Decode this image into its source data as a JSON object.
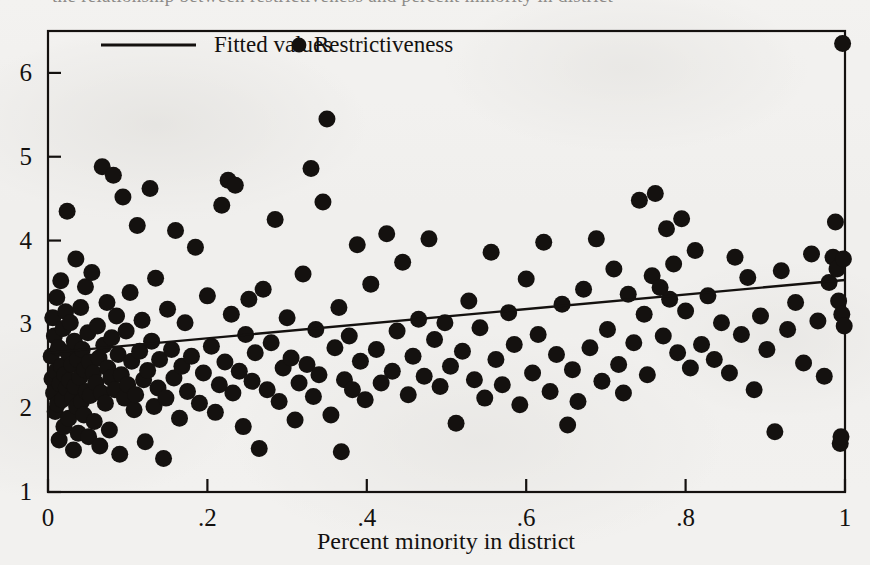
{
  "figure": {
    "caption_ghost": "the relationship between restrictiveness and percent minority in district",
    "background_color": "#f2f1ef",
    "ink_color": "#14110f"
  },
  "legend": {
    "position": "top-inside",
    "entries": [
      {
        "label": "Fitted values",
        "marker": "line",
        "color": "#14110f"
      },
      {
        "label": "Restrictiveness",
        "marker": "circle",
        "color": "#14110f"
      }
    ]
  },
  "chart_data": {
    "type": "scatter",
    "title": "",
    "subtitle": "",
    "xlabel": "Percent minority in district",
    "ylabel": "",
    "xlim": [
      0,
      1
    ],
    "ylim": [
      1,
      6.5
    ],
    "grid": false,
    "xticks": [
      0,
      0.2,
      0.4,
      0.6,
      0.8,
      1
    ],
    "xticklabels": [
      "0",
      ".2",
      ".4",
      ".6",
      ".8",
      "1"
    ],
    "yticks": [
      1,
      2,
      3,
      4,
      5,
      6
    ],
    "yticklabels": [
      "1",
      "2",
      "3",
      "4",
      "5",
      "6"
    ],
    "marker_color": "#14110f",
    "marker_size": 9,
    "series": [
      {
        "name": "Restrictiveness",
        "type": "scatter",
        "points": [
          [
            0.004,
            2.62
          ],
          [
            0.005,
            2.35
          ],
          [
            0.006,
            3.08
          ],
          [
            0.007,
            2.18
          ],
          [
            0.008,
            2.86
          ],
          [
            0.009,
            1.96
          ],
          [
            0.01,
            2.44
          ],
          [
            0.011,
            3.32
          ],
          [
            0.012,
            2.05
          ],
          [
            0.013,
            2.72
          ],
          [
            0.014,
            1.62
          ],
          [
            0.015,
            2.29
          ],
          [
            0.016,
            3.52
          ],
          [
            0.017,
            2.5
          ],
          [
            0.018,
            2.1
          ],
          [
            0.019,
            2.95
          ],
          [
            0.02,
            1.78
          ],
          [
            0.021,
            2.4
          ],
          [
            0.022,
            3.15
          ],
          [
            0.023,
            2.24
          ],
          [
            0.024,
            4.35
          ],
          [
            0.025,
            2.66
          ],
          [
            0.026,
            1.88
          ],
          [
            0.027,
            2.33
          ],
          [
            0.028,
            3.02
          ],
          [
            0.03,
            2.52
          ],
          [
            0.031,
            2.12
          ],
          [
            0.032,
            1.5
          ],
          [
            0.033,
            2.8
          ],
          [
            0.034,
            2.26
          ],
          [
            0.035,
            3.78
          ],
          [
            0.036,
            2.02
          ],
          [
            0.037,
            2.58
          ],
          [
            0.038,
            1.7
          ],
          [
            0.04,
            2.37
          ],
          [
            0.041,
            3.2
          ],
          [
            0.042,
            2.08
          ],
          [
            0.043,
            2.7
          ],
          [
            0.045,
            1.92
          ],
          [
            0.046,
            2.46
          ],
          [
            0.047,
            3.45
          ],
          [
            0.048,
            2.2
          ],
          [
            0.05,
            2.9
          ],
          [
            0.051,
            1.66
          ],
          [
            0.052,
            2.55
          ],
          [
            0.053,
            2.15
          ],
          [
            0.055,
            3.62
          ],
          [
            0.057,
            2.42
          ],
          [
            0.058,
            1.84
          ],
          [
            0.06,
            2.3
          ],
          [
            0.062,
            2.98
          ],
          [
            0.064,
            2.6
          ],
          [
            0.065,
            1.55
          ],
          [
            0.067,
            2.18
          ],
          [
            0.068,
            4.88
          ],
          [
            0.07,
            2.75
          ],
          [
            0.072,
            2.06
          ],
          [
            0.074,
            3.26
          ],
          [
            0.075,
            2.48
          ],
          [
            0.077,
            1.74
          ],
          [
            0.079,
            2.36
          ],
          [
            0.08,
            2.84
          ],
          [
            0.082,
            4.78
          ],
          [
            0.084,
            2.22
          ],
          [
            0.086,
            3.1
          ],
          [
            0.088,
            2.64
          ],
          [
            0.09,
            1.45
          ],
          [
            0.092,
            2.4
          ],
          [
            0.094,
            4.52
          ],
          [
            0.096,
            2.12
          ],
          [
            0.098,
            2.92
          ],
          [
            0.1,
            2.28
          ],
          [
            0.103,
            3.38
          ],
          [
            0.105,
            2.56
          ],
          [
            0.108,
            1.98
          ],
          [
            0.11,
            2.16
          ],
          [
            0.112,
            4.18
          ],
          [
            0.115,
            2.68
          ],
          [
            0.118,
            3.05
          ],
          [
            0.12,
            2.34
          ],
          [
            0.122,
            1.6
          ],
          [
            0.125,
            2.45
          ],
          [
            0.128,
            4.62
          ],
          [
            0.13,
            2.8
          ],
          [
            0.133,
            2.02
          ],
          [
            0.135,
            3.55
          ],
          [
            0.138,
            2.24
          ],
          [
            0.14,
            2.58
          ],
          [
            0.145,
            1.4
          ],
          [
            0.148,
            2.12
          ],
          [
            0.15,
            3.18
          ],
          [
            0.155,
            2.7
          ],
          [
            0.158,
            2.36
          ],
          [
            0.16,
            4.12
          ],
          [
            0.165,
            1.88
          ],
          [
            0.168,
            2.5
          ],
          [
            0.172,
            3.02
          ],
          [
            0.175,
            2.2
          ],
          [
            0.18,
            2.62
          ],
          [
            0.185,
            3.92
          ],
          [
            0.19,
            2.06
          ],
          [
            0.195,
            2.42
          ],
          [
            0.2,
            3.34
          ],
          [
            0.205,
            2.74
          ],
          [
            0.21,
            1.95
          ],
          [
            0.215,
            2.28
          ],
          [
            0.218,
            4.42
          ],
          [
            0.222,
            2.55
          ],
          [
            0.226,
            4.72
          ],
          [
            0.23,
            3.12
          ],
          [
            0.232,
            2.18
          ],
          [
            0.235,
            4.66
          ],
          [
            0.24,
            2.44
          ],
          [
            0.245,
            1.78
          ],
          [
            0.248,
            2.88
          ],
          [
            0.252,
            3.3
          ],
          [
            0.256,
            2.32
          ],
          [
            0.26,
            2.66
          ],
          [
            0.265,
            1.52
          ],
          [
            0.27,
            3.42
          ],
          [
            0.275,
            2.22
          ],
          [
            0.28,
            2.78
          ],
          [
            0.285,
            4.25
          ],
          [
            0.29,
            2.08
          ],
          [
            0.295,
            2.48
          ],
          [
            0.3,
            3.08
          ],
          [
            0.305,
            2.6
          ],
          [
            0.31,
            1.86
          ],
          [
            0.315,
            2.3
          ],
          [
            0.32,
            3.6
          ],
          [
            0.325,
            2.52
          ],
          [
            0.33,
            4.86
          ],
          [
            0.333,
            2.14
          ],
          [
            0.336,
            2.94
          ],
          [
            0.34,
            2.4
          ],
          [
            0.345,
            4.46
          ],
          [
            0.35,
            5.45
          ],
          [
            0.355,
            1.92
          ],
          [
            0.36,
            2.72
          ],
          [
            0.365,
            3.2
          ],
          [
            0.368,
            1.48
          ],
          [
            0.372,
            2.34
          ],
          [
            0.378,
            2.86
          ],
          [
            0.382,
            2.22
          ],
          [
            0.388,
            3.95
          ],
          [
            0.392,
            2.56
          ],
          [
            0.398,
            2.1
          ],
          [
            0.405,
            3.48
          ],
          [
            0.412,
            2.7
          ],
          [
            0.418,
            2.3
          ],
          [
            0.425,
            4.08
          ],
          [
            0.432,
            2.44
          ],
          [
            0.438,
            2.92
          ],
          [
            0.445,
            3.74
          ],
          [
            0.452,
            2.16
          ],
          [
            0.458,
            2.62
          ],
          [
            0.465,
            3.06
          ],
          [
            0.472,
            2.38
          ],
          [
            0.478,
            4.02
          ],
          [
            0.485,
            2.82
          ],
          [
            0.492,
            2.26
          ],
          [
            0.498,
            3.02
          ],
          [
            0.505,
            2.5
          ],
          [
            0.512,
            1.82
          ],
          [
            0.52,
            2.68
          ],
          [
            0.528,
            3.28
          ],
          [
            0.535,
            2.34
          ],
          [
            0.542,
            2.96
          ],
          [
            0.548,
            2.12
          ],
          [
            0.556,
            3.86
          ],
          [
            0.562,
            2.58
          ],
          [
            0.57,
            2.28
          ],
          [
            0.578,
            3.14
          ],
          [
            0.585,
            2.76
          ],
          [
            0.592,
            2.04
          ],
          [
            0.6,
            3.54
          ],
          [
            0.608,
            2.42
          ],
          [
            0.615,
            2.88
          ],
          [
            0.622,
            3.98
          ],
          [
            0.63,
            2.2
          ],
          [
            0.638,
            2.64
          ],
          [
            0.645,
            3.24
          ],
          [
            0.652,
            1.8
          ],
          [
            0.658,
            2.46
          ],
          [
            0.665,
            2.08
          ],
          [
            0.672,
            3.42
          ],
          [
            0.68,
            2.72
          ],
          [
            0.688,
            4.02
          ],
          [
            0.695,
            2.32
          ],
          [
            0.702,
            2.94
          ],
          [
            0.71,
            3.66
          ],
          [
            0.716,
            2.52
          ],
          [
            0.722,
            2.18
          ],
          [
            0.728,
            3.36
          ],
          [
            0.735,
            2.78
          ],
          [
            0.742,
            4.48
          ],
          [
            0.748,
            3.12
          ],
          [
            0.752,
            2.4
          ],
          [
            0.758,
            3.58
          ],
          [
            0.762,
            4.56
          ],
          [
            0.768,
            3.44
          ],
          [
            0.772,
            2.86
          ],
          [
            0.776,
            4.14
          ],
          [
            0.78,
            3.3
          ],
          [
            0.785,
            3.72
          ],
          [
            0.79,
            2.66
          ],
          [
            0.795,
            4.26
          ],
          [
            0.8,
            3.16
          ],
          [
            0.806,
            2.48
          ],
          [
            0.812,
            3.88
          ],
          [
            0.82,
            2.76
          ],
          [
            0.828,
            3.34
          ],
          [
            0.836,
            2.58
          ],
          [
            0.845,
            3.02
          ],
          [
            0.855,
            2.42
          ],
          [
            0.862,
            3.8
          ],
          [
            0.87,
            2.88
          ],
          [
            0.878,
            3.56
          ],
          [
            0.886,
            2.22
          ],
          [
            0.894,
            3.1
          ],
          [
            0.902,
            2.7
          ],
          [
            0.912,
            1.72
          ],
          [
            0.92,
            3.64
          ],
          [
            0.928,
            2.94
          ],
          [
            0.938,
            3.26
          ],
          [
            0.948,
            2.54
          ],
          [
            0.958,
            3.84
          ],
          [
            0.966,
            3.04
          ],
          [
            0.974,
            2.38
          ],
          [
            0.98,
            3.5
          ],
          [
            0.985,
            3.8
          ],
          [
            0.988,
            4.22
          ],
          [
            0.99,
            3.66
          ],
          [
            0.992,
            3.28
          ],
          [
            0.994,
            1.58
          ],
          [
            0.995,
            1.66
          ],
          [
            0.996,
            3.12
          ],
          [
            0.997,
            6.35
          ],
          [
            0.998,
            3.78
          ],
          [
            0.999,
            2.98
          ]
        ]
      },
      {
        "name": "Fitted values",
        "type": "line",
        "points": [
          [
            0.0,
            2.66
          ],
          [
            1.0,
            3.53
          ]
        ],
        "color": "#14110f"
      }
    ]
  }
}
